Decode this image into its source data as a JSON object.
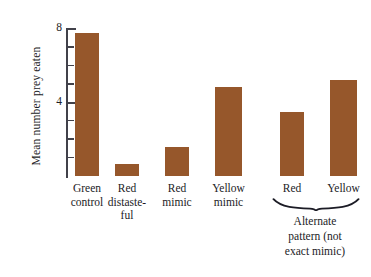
{
  "chart_data": {
    "type": "bar",
    "title": "",
    "xlabel": "",
    "ylabel": "Mean number prey eaten",
    "ylim": [
      0,
      8
    ],
    "ytick_values": [
      1,
      2,
      3,
      4,
      5,
      6,
      7,
      8
    ],
    "ytick_labels_shown": [
      "4",
      "8"
    ],
    "grid": false,
    "legend": "none",
    "categories": [
      "Green\ncontrol",
      "Red\ndistaste-\nful",
      "Red\nmimic",
      "Yellow\nmimic",
      "Red",
      "Yellow"
    ],
    "values": [
      7.8,
      0.65,
      1.6,
      4.85,
      3.5,
      5.2
    ],
    "bar_color": "#96572b",
    "annotations": [
      {
        "text": "Alternate\npattern (not\nexact mimic)",
        "covers_categories": [
          "Red",
          "Yellow"
        ],
        "marker": "curly-brace"
      }
    ]
  },
  "axis": {
    "label_8": "8",
    "label_4": "4"
  },
  "group": {
    "caption_line1": "Alternate",
    "caption_line2": "pattern (not",
    "caption_line3": "exact mimic)"
  },
  "categories_display": [
    {
      "line1": "Green",
      "line2": "control",
      "line3": ""
    },
    {
      "line1": "Red",
      "line2": "distaste-",
      "line3": "ful"
    },
    {
      "line1": "Red",
      "line2": "mimic",
      "line3": ""
    },
    {
      "line1": "Yellow",
      "line2": "mimic",
      "line3": ""
    },
    {
      "line1": "Red",
      "line2": "",
      "line3": ""
    },
    {
      "line1": "Yellow",
      "line2": "",
      "line3": ""
    }
  ]
}
